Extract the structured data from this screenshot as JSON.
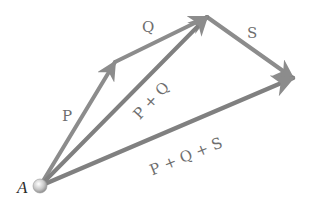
{
  "diagram": {
    "colors": {
      "arrow": "#8c8c8c",
      "arrow_dark": "#7a7a7a",
      "label": "#6e6e6e",
      "origin_label": "#2a2a2a",
      "origin_point": "#c8c8c8"
    },
    "origin": {
      "label": "A",
      "x": 40,
      "y": 186
    },
    "points": {
      "A": [
        40,
        186
      ],
      "P_tip": [
        115,
        62
      ],
      "Q_tip": [
        207,
        17
      ],
      "S_tip": [
        293,
        78
      ]
    },
    "vectors": [
      {
        "id": "P",
        "label": "P",
        "from": "A",
        "to": "P_tip",
        "label_pos": [
          67,
          120
        ],
        "rotate": 0
      },
      {
        "id": "Q",
        "label": "Q",
        "from": "P_tip",
        "to": "Q_tip",
        "label_pos": [
          148,
          31
        ],
        "rotate": 0
      },
      {
        "id": "S",
        "label": "S",
        "from": "Q_tip",
        "to": "S_tip",
        "label_pos": [
          253,
          37
        ],
        "rotate": 0
      },
      {
        "id": "PQ",
        "label": "P + Q",
        "from": "A",
        "to": "Q_tip",
        "label_pos": [
          158,
          104
        ],
        "rotate": -47
      },
      {
        "id": "PQS",
        "label": "P + Q + S",
        "from": "A",
        "to": "S_tip",
        "label_pos": [
          190,
          160
        ],
        "rotate": -22
      }
    ]
  }
}
